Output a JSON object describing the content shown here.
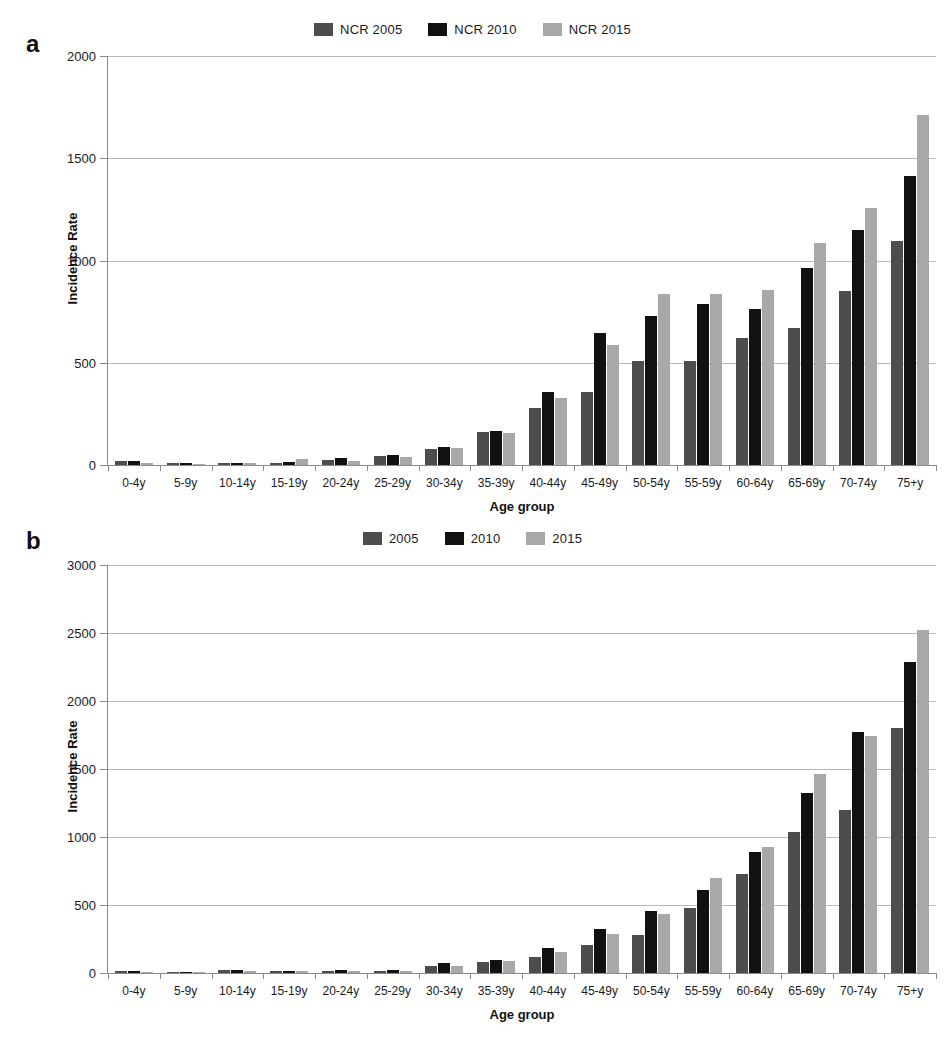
{
  "figure": {
    "panels": [
      "a",
      "b"
    ],
    "axis_title_x": "Age group",
    "axis_title_y": "Incidence Rate"
  },
  "colors": {
    "series_2005": "#4d4d4d",
    "series_2010": "#111111",
    "series_2015": "#a8a8a8",
    "gridline": "#b9b9b9",
    "axis": "#8a8a8a",
    "text": "#1a1a1a"
  },
  "panel_a": {
    "letter": "a",
    "legend": [
      {
        "label": "NCR 2005",
        "color": "#4d4d4d"
      },
      {
        "label": "NCR 2010",
        "color": "#111111"
      },
      {
        "label": "NCR 2015",
        "color": "#a8a8a8"
      }
    ],
    "yticks": [
      "0",
      "500",
      "1000",
      "1500",
      "2000"
    ]
  },
  "panel_b": {
    "letter": "b",
    "legend": [
      {
        "label": "2005",
        "color": "#4d4d4d"
      },
      {
        "label": "2010",
        "color": "#111111"
      },
      {
        "label": "2015",
        "color": "#a8a8a8"
      }
    ],
    "yticks": [
      "0",
      "500",
      "1000",
      "1500",
      "2000",
      "2500",
      "3000"
    ]
  },
  "chart_data": [
    {
      "panel": "a",
      "type": "bar",
      "title": "",
      "xlabel": "Age group",
      "ylabel": "Incidence Rate",
      "ylim": [
        0,
        2000
      ],
      "ytick_step": 500,
      "grid": true,
      "legend_position": "top-center",
      "categories": [
        "0-4y",
        "5-9y",
        "10-14y",
        "15-19y",
        "20-24y",
        "25-29y",
        "30-34y",
        "35-39y",
        "40-44y",
        "45-49y",
        "50-54y",
        "55-59y",
        "60-64y",
        "65-69y",
        "70-74y",
        "75+y"
      ],
      "series": [
        {
          "name": "NCR 2005",
          "color": "#4d4d4d",
          "values": [
            18,
            9,
            8,
            10,
            25,
            42,
            78,
            160,
            278,
            355,
            508,
            508,
            622,
            672,
            850,
            1095
          ]
        },
        {
          "name": "NCR 2010",
          "color": "#111111",
          "values": [
            20,
            10,
            10,
            14,
            32,
            50,
            90,
            165,
            357,
            645,
            730,
            785,
            762,
            962,
            1150,
            1415
          ]
        },
        {
          "name": "NCR 2015",
          "color": "#a8a8a8",
          "values": [
            8,
            7,
            9,
            28,
            22,
            40,
            82,
            158,
            327,
            585,
            835,
            838,
            858,
            1085,
            1255,
            1710
          ]
        }
      ]
    },
    {
      "panel": "b",
      "type": "bar",
      "title": "",
      "xlabel": "Age group",
      "ylabel": "Incidence Rate",
      "ylim": [
        0,
        3000
      ],
      "ytick_step": 500,
      "grid": true,
      "legend_position": "top-center",
      "categories": [
        "0-4y",
        "5-9y",
        "10-14y",
        "15-19y",
        "20-24y",
        "25-29y",
        "30-34y",
        "35-39y",
        "40-44y",
        "45-49y",
        "50-54y",
        "55-59y",
        "60-64y",
        "65-69y",
        "70-74y",
        "75+y"
      ],
      "series": [
        {
          "name": "2005",
          "color": "#4d4d4d",
          "values": [
            12,
            8,
            20,
            14,
            18,
            16,
            52,
            78,
            118,
            205,
            282,
            475,
            728,
            1035,
            1195,
            1800
          ]
        },
        {
          "name": "2010",
          "color": "#111111",
          "values": [
            14,
            10,
            24,
            16,
            22,
            20,
            70,
            95,
            185,
            320,
            455,
            612,
            890,
            1325,
            1775,
            2290
          ]
        },
        {
          "name": "2015",
          "color": "#a8a8a8",
          "values": [
            8,
            6,
            14,
            12,
            16,
            14,
            55,
            88,
            155,
            288,
            432,
            695,
            930,
            1460,
            1745,
            2520
          ]
        }
      ]
    }
  ]
}
